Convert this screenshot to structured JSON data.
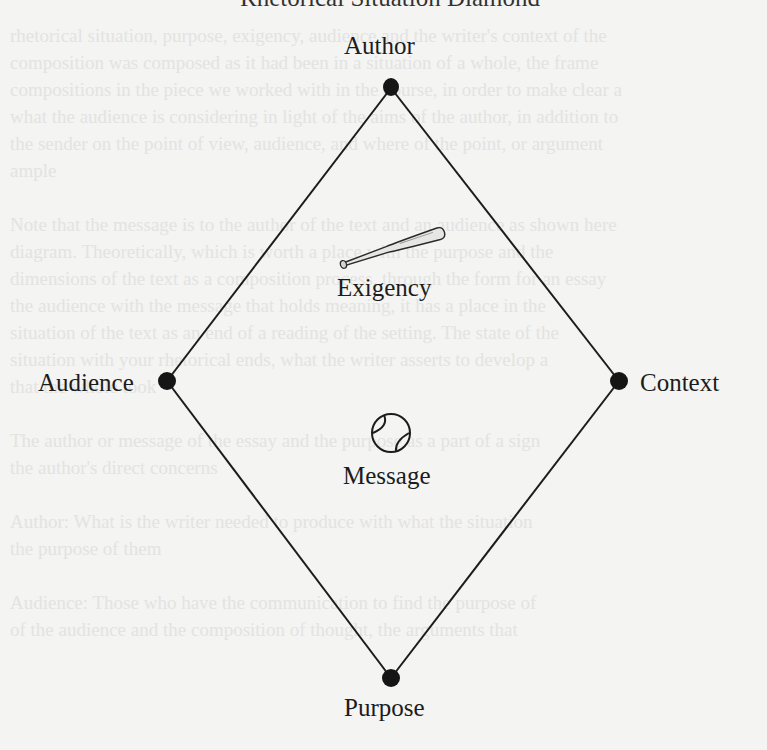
{
  "diagram": {
    "title_partial": "Rhetorical Situation Diamond",
    "nodes": [
      {
        "id": "author",
        "label": "Author",
        "position": "top"
      },
      {
        "id": "audience",
        "label": "Audience",
        "position": "left"
      },
      {
        "id": "context",
        "label": "Context",
        "position": "right"
      },
      {
        "id": "purpose",
        "label": "Purpose",
        "position": "bottom"
      }
    ],
    "center_items": [
      {
        "id": "exigency",
        "label": "Exigency",
        "icon": "baseball-bat-icon"
      },
      {
        "id": "message",
        "label": "Message",
        "icon": "baseball-icon"
      }
    ],
    "colors": {
      "line": "#1c1c1c",
      "node": "#151515",
      "background": "#f4f4f3",
      "bleed_text": "#e3e3e2"
    }
  }
}
